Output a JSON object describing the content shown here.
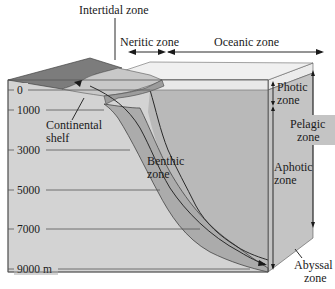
{
  "diagram": {
    "type": "ocean-zones-block-diagram",
    "top_labels": {
      "intertidal": "Intertidal zone",
      "neritic": "Neritic zone",
      "oceanic": "Oceanic zone"
    },
    "side_labels": {
      "photic_line1": "Photic",
      "photic_line2": "zone",
      "pelagic_line1": "Pelagic",
      "pelagic_line2": "zone",
      "aphotic_line1": "Aphotic",
      "aphotic_line2": "zone",
      "abyssal_line1": "Abyssal",
      "abyssal_line2": "zone"
    },
    "interior_labels": {
      "shelf_line1": "Continental",
      "shelf_line2": "shelf",
      "benthic_line1": "Benthic",
      "benthic_line2": "zone"
    },
    "depth_ticks": [
      {
        "label": "0",
        "y": 90
      },
      {
        "label": "1000",
        "y": 110
      },
      {
        "label": "3000",
        "y": 150
      },
      {
        "label": "5000",
        "y": 190
      },
      {
        "label": "7000",
        "y": 229
      },
      {
        "label": "9000 m",
        "y": 269
      }
    ],
    "colors": {
      "land_top": "#7a7a7a",
      "shelf_top": "#c4c4c4",
      "photic_water": "#e6e6e6",
      "deep_water": "#b7b7b7",
      "front_face": "#d0d0d0",
      "benthic_band": "#a9a9a9",
      "side_face": "#c2c2c2",
      "line": "#2a2a2a"
    }
  }
}
